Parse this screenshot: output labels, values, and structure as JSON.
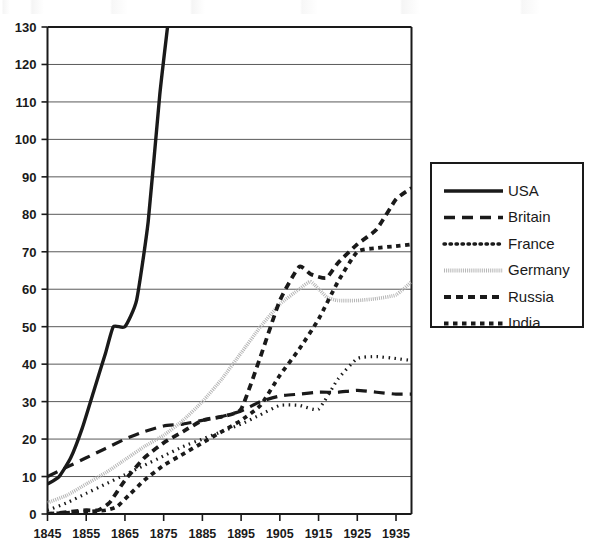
{
  "chart_data": {
    "type": "line",
    "title": "",
    "subtitle": "",
    "xlabel": "",
    "ylabel": "",
    "xlim": [
      1845,
      1939
    ],
    "ylim": [
      0,
      130
    ],
    "grid": true,
    "legend_position": "right",
    "x_ticks": [
      "1845",
      "1855",
      "1865",
      "1875",
      "1885",
      "1895",
      "1905",
      "1915",
      "1925",
      "1935"
    ],
    "y_ticks": [
      "0",
      "10",
      "20",
      "30",
      "40",
      "50",
      "60",
      "70",
      "80",
      "90",
      "100",
      "110",
      "120",
      "130"
    ],
    "x_tick_values": [
      1845,
      1855,
      1865,
      1875,
      1885,
      1895,
      1905,
      1915,
      1925,
      1935
    ],
    "y_tick_values": [
      0,
      10,
      20,
      30,
      40,
      50,
      60,
      70,
      80,
      90,
      100,
      110,
      120,
      130
    ],
    "series": [
      {
        "name": "USA",
        "style": "solid",
        "color": "#1a1a1a",
        "width": 3.4,
        "dash": "",
        "x": [
          1845,
          1848,
          1851,
          1854,
          1857,
          1860,
          1862,
          1865,
          1868,
          1871,
          1874,
          1876
        ],
        "values": [
          8,
          10,
          15,
          23,
          33,
          43,
          50,
          50,
          57,
          78,
          112,
          130
        ]
      },
      {
        "name": "Britain",
        "style": "long-dash",
        "color": "#1a1a1a",
        "width": 3.2,
        "dash": "11 7",
        "x": [
          1845,
          1850,
          1855,
          1860,
          1865,
          1870,
          1875,
          1880,
          1885,
          1890,
          1895,
          1900,
          1905,
          1910,
          1915,
          1920,
          1925,
          1930,
          1935,
          1939
        ],
        "values": [
          10,
          12.5,
          15,
          17.5,
          20,
          22,
          23.5,
          24,
          25,
          26,
          27.5,
          30,
          31.5,
          32,
          32.5,
          32.5,
          33,
          32.5,
          32,
          32
        ]
      },
      {
        "name": "France",
        "style": "fine-dotted",
        "color": "#1a1a1a",
        "width": 3.2,
        "dash": "1.5 4.5",
        "x": [
          1845,
          1850,
          1855,
          1860,
          1865,
          1870,
          1875,
          1880,
          1885,
          1890,
          1895,
          1900,
          1905,
          1910,
          1915,
          1920,
          1925,
          1930,
          1935,
          1939
        ],
        "values": [
          1,
          3,
          5.5,
          8,
          10.5,
          13,
          15.5,
          18,
          20,
          22,
          24,
          26.5,
          29,
          29,
          28,
          36,
          41.5,
          42,
          41.5,
          41
        ]
      },
      {
        "name": "Germany",
        "style": "hatched",
        "color": "#b5b5b5",
        "width": 3.6,
        "dash": "1 1.1",
        "x": [
          1845,
          1850,
          1855,
          1860,
          1865,
          1870,
          1875,
          1880,
          1885,
          1890,
          1895,
          1900,
          1905,
          1910,
          1913,
          1917,
          1920,
          1925,
          1930,
          1935,
          1939
        ],
        "values": [
          3,
          5,
          8,
          11,
          14.5,
          18,
          21,
          25,
          30,
          36,
          43,
          50,
          56,
          60,
          62,
          58,
          57,
          57,
          57.5,
          58.5,
          62
        ]
      },
      {
        "name": "Russia",
        "style": "medium-dash",
        "color": "#1a1a1a",
        "width": 3.8,
        "dash": "7 5",
        "x": [
          1845,
          1850,
          1855,
          1858,
          1861,
          1865,
          1870,
          1875,
          1880,
          1885,
          1890,
          1895,
          1900,
          1905,
          1910,
          1913,
          1917,
          1920,
          1925,
          1930,
          1935,
          1939
        ],
        "values": [
          0,
          0.5,
          1,
          1,
          3,
          9,
          15,
          19,
          22,
          25,
          26,
          28,
          42,
          57,
          66,
          64,
          63,
          67,
          72,
          76,
          84,
          87
        ]
      },
      {
        "name": "India",
        "style": "square-dash",
        "color": "#1a1a1a",
        "width": 3.8,
        "dash": "4.5 4.5",
        "x": [
          1845,
          1850,
          1855,
          1860,
          1863,
          1866,
          1870,
          1875,
          1880,
          1885,
          1890,
          1895,
          1900,
          1905,
          1910,
          1915,
          1920,
          1925,
          1930,
          1935,
          1939
        ],
        "values": [
          0,
          0.3,
          0.6,
          1,
          2,
          5,
          9,
          13,
          16,
          19,
          22,
          25,
          29,
          37,
          44,
          52,
          62,
          70,
          71,
          71.5,
          72
        ]
      }
    ],
    "legend": [
      {
        "label": "USA",
        "style": "solid",
        "dash": "",
        "color": "#1a1a1a",
        "width": 3.4
      },
      {
        "label": "Britain",
        "style": "long-dash",
        "dash": "11 7",
        "color": "#1a1a1a",
        "width": 3.4
      },
      {
        "label": "France",
        "style": "fine-dotted",
        "dash": "1.5 4.5",
        "color": "#1a1a1a",
        "width": 3.4
      },
      {
        "label": "Germany",
        "style": "hatched",
        "dash": "1 1.1",
        "color": "#b5b5b5",
        "width": 3.8
      },
      {
        "label": "Russia",
        "style": "medium-dash",
        "dash": "7 5",
        "color": "#1a1a1a",
        "width": 3.8
      },
      {
        "label": "India",
        "style": "square-dash",
        "dash": "4.5 4.5",
        "color": "#1a1a1a",
        "width": 3.8
      }
    ]
  },
  "colors": {
    "background": "#ffffff",
    "axis": "#1a1a1a",
    "grid": "#595959",
    "text": "#1a1a1a",
    "germany_line": "#b5b5b5"
  }
}
